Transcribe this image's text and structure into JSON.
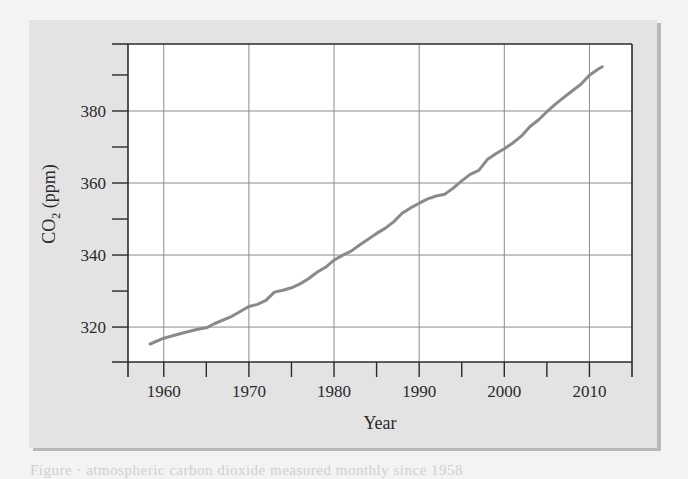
{
  "chart_data": {
    "type": "line",
    "title": "",
    "xlabel": "Year",
    "ylabel": "CO2 (ppm)",
    "ylabel_main": "CO",
    "ylabel_sub": "2",
    "ylabel_unit": " (ppm)",
    "xlim": [
      1955.8,
      2015
    ],
    "ylim": [
      310.3,
      398.6
    ],
    "x_ticks_major": [
      1960,
      1970,
      1980,
      1990,
      2000,
      2010
    ],
    "x_ticks_minor": [
      1965,
      1975,
      1985,
      1995,
      2005,
      2015
    ],
    "y_ticks_major": [
      320,
      340,
      360,
      380
    ],
    "y_ticks_minor": [
      330,
      350,
      370,
      390
    ],
    "grid": true,
    "legend": null,
    "series": [
      {
        "name": "Atmospheric CO2",
        "color": "#8a8a8a",
        "x": [
          1958.4,
          1960,
          1962,
          1964,
          1965,
          1966,
          1968,
          1970,
          1971,
          1972,
          1973,
          1974,
          1975,
          1976,
          1977,
          1978,
          1979,
          1980,
          1981,
          1982,
          1983,
          1984,
          1985,
          1986,
          1987,
          1988,
          1989,
          1990,
          1991,
          1992,
          1993,
          1994,
          1995,
          1996,
          1997,
          1998,
          1999,
          2000,
          2001,
          2002,
          2003,
          2004,
          2005,
          2006,
          2007,
          2008,
          2009,
          2010,
          2011,
          2011.5
        ],
        "values": [
          315.3,
          316.9,
          318.2,
          319.4,
          319.8,
          321.0,
          323.0,
          325.7,
          326.3,
          327.4,
          329.7,
          330.2,
          330.9,
          332.0,
          333.4,
          335.2,
          336.6,
          338.6,
          339.9,
          341.1,
          342.8,
          344.4,
          346.0,
          347.4,
          349.2,
          351.6,
          353.1,
          354.4,
          355.6,
          356.4,
          356.9,
          358.6,
          360.6,
          362.4,
          363.5,
          366.5,
          368.1,
          369.5,
          371.1,
          373.0,
          375.6,
          377.5,
          379.8,
          381.9,
          383.8,
          385.6,
          387.4,
          389.9,
          391.6,
          392.3
        ]
      }
    ]
  },
  "caption_fragment": "Figure  ·  atmospheric carbon dioxide measured monthly since 1958"
}
